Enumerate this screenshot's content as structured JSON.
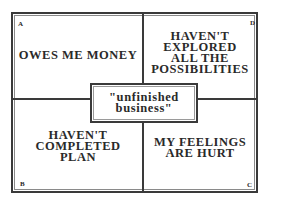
{
  "diagram": {
    "quadrants": {
      "A": {
        "corner_label": "A",
        "text": "OWES ME MONEY"
      },
      "B": {
        "corner_label": "B",
        "line1": "HAVEN'T",
        "line2": "COMPLETED",
        "line3": "PLAN"
      },
      "C": {
        "corner_label": "C",
        "line1": "MY FEELINGS",
        "line2": "ARE HURT"
      },
      "D": {
        "corner_label": "D",
        "line1": "HAVEN'T",
        "line2": "EXPLORED",
        "line3": "ALL THE",
        "line4": "POSSIBILITIES"
      }
    },
    "center": {
      "line1": "\"unfinished",
      "line2": "business\""
    }
  }
}
